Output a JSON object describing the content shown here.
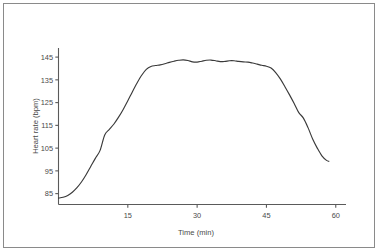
{
  "figure": {
    "border_color": "#8a8a8a",
    "background": "#ffffff"
  },
  "chart_data": {
    "type": "line",
    "title": "",
    "xlabel": "Time (min)",
    "ylabel": "Heart rate (bpm)",
    "xlim": [
      0,
      62
    ],
    "ylim": [
      80,
      149
    ],
    "xticks": [
      15,
      30,
      45,
      60
    ],
    "xtick_labels": [
      "15",
      "30",
      "45",
      "60"
    ],
    "yticks": [
      85,
      95,
      105,
      115,
      125,
      135,
      145
    ],
    "ytick_labels": [
      "85",
      "95",
      "105",
      "115",
      "125",
      "135",
      "145"
    ],
    "grid": false,
    "legend": false,
    "line_color": "#3a3a3a",
    "axis_color": "#5a5a5a",
    "series": [
      {
        "name": "Heart rate",
        "x": [
          0,
          1,
          2,
          3,
          4,
          5,
          6,
          7,
          8,
          9,
          10,
          11,
          12,
          13,
          14,
          15,
          16,
          17,
          18,
          19,
          20,
          21,
          22,
          23,
          24,
          25,
          26,
          27,
          28,
          29,
          30,
          31,
          32,
          33,
          34,
          35,
          36,
          37,
          38,
          39,
          40,
          41,
          42,
          43,
          44,
          45,
          46,
          47,
          48,
          49,
          50,
          51,
          52,
          53,
          54,
          55,
          56,
          57,
          58,
          58.5
        ],
        "values": [
          83.0,
          83.4,
          84.2,
          85.6,
          87.6,
          90.2,
          93.4,
          97.0,
          100.6,
          104.0,
          110.8,
          113.2,
          115.6,
          118.6,
          122.0,
          125.8,
          129.8,
          133.6,
          137.0,
          139.6,
          140.9,
          141.3,
          141.6,
          142.1,
          142.7,
          143.2,
          143.6,
          143.8,
          143.5,
          142.9,
          142.8,
          143.2,
          143.6,
          143.7,
          143.4,
          143.0,
          143.1,
          143.4,
          143.4,
          143.1,
          142.9,
          142.8,
          142.4,
          141.9,
          141.4,
          141.0,
          140.2,
          138.2,
          135.4,
          132.0,
          128.4,
          124.6,
          120.6,
          118.2,
          114.0,
          109.0,
          105.0,
          101.6,
          99.6,
          99.2
        ]
      }
    ]
  }
}
